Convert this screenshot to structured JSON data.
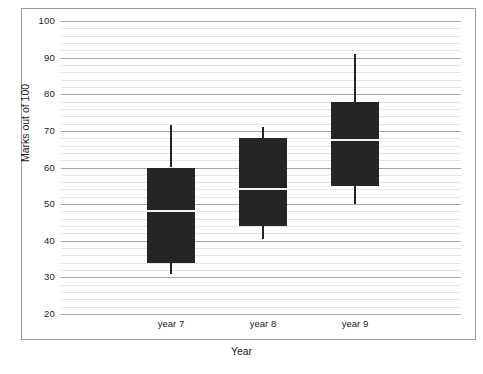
{
  "chart_data": {
    "type": "box",
    "title": "",
    "xlabel": "Year",
    "ylabel": "Marks out of 100",
    "categories": [
      "year 7",
      "year 8",
      "year 9"
    ],
    "ylim": [
      20,
      100
    ],
    "ytick_labels": [
      "20",
      "30",
      "40",
      "50",
      "60",
      "70",
      "80",
      "90",
      "100"
    ],
    "ytick_values": [
      20,
      30,
      40,
      50,
      60,
      70,
      80,
      90,
      100
    ],
    "grid": {
      "major_step": 10,
      "minor_step": 2,
      "orientation": "horizontal",
      "visible": true
    },
    "legend": {
      "visible": false,
      "position": "none"
    },
    "series": [
      {
        "name": "year 7",
        "min": 31,
        "q1": 34,
        "median": 48,
        "q3": 60,
        "max": 71.5
      },
      {
        "name": "year 8",
        "min": 40.5,
        "q1": 44,
        "median": 54,
        "q3": 68,
        "max": 71
      },
      {
        "name": "year 9",
        "min": 50,
        "q1": 55,
        "median": 67.5,
        "q3": 78,
        "max": 91
      }
    ],
    "colors": {
      "box_fill": "#252525",
      "median": "#f2f2f2",
      "whisker": "#252525",
      "gridline_major": "#a8a8a8",
      "gridline_minor": "#e4e4e4",
      "frame": "#9a9a9a",
      "text": "#1a1a1a",
      "background": "#ffffff"
    }
  }
}
